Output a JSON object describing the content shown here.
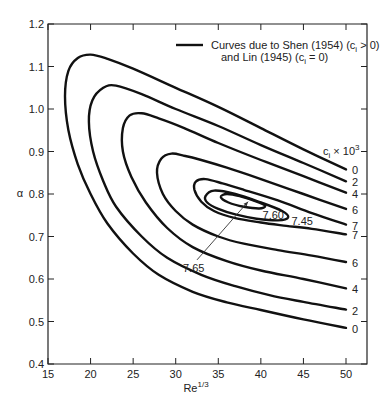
{
  "chart_data": {
    "type": "line",
    "title": "",
    "xlabel": "Re",
    "xlabel_sup": "1/3",
    "ylabel": "α",
    "xlim": [
      15,
      52
    ],
    "ylim": [
      0.4,
      1.2
    ],
    "x_ticks": [
      15,
      20,
      25,
      30,
      35,
      40,
      45,
      50
    ],
    "x_tick_labels": [
      "15",
      "20",
      "25",
      "30",
      "35",
      "40",
      "45",
      "50"
    ],
    "y_ticks": [
      0.4,
      0.5,
      0.6,
      0.7,
      0.8,
      0.9,
      1.0,
      1.1,
      1.2
    ],
    "y_tick_labels": [
      "0.4",
      "0.5",
      "0.6",
      "0.7",
      "0.8",
      "0.9",
      "1.0",
      "1.1",
      "1.2"
    ],
    "grid": false,
    "legend": {
      "placement": "top-right",
      "line1": "Curves due to Shen (1954) (c",
      "line1_sub": "i",
      "line1_end": " > 0)",
      "line2": "and Lin (1945) (c",
      "line2_sub": "i",
      "line2_end": " = 0)"
    },
    "curve_group_label": {
      "base": "c",
      "sub": "i",
      "mid": " × 10",
      "sup": "3"
    },
    "series": [
      {
        "name": "0",
        "upper_label": "0",
        "lower_label": "0",
        "points": [
          [
            50,
            0.858
          ],
          [
            45,
            0.905
          ],
          [
            40,
            0.955
          ],
          [
            35,
            1.005
          ],
          [
            30,
            1.05
          ],
          [
            25,
            1.095
          ],
          [
            22,
            1.118
          ],
          [
            20,
            1.128
          ],
          [
            18.5,
            1.12
          ],
          [
            17.4,
            1.09
          ],
          [
            17,
            1.03
          ],
          [
            17.4,
            0.95
          ],
          [
            18.5,
            0.87
          ],
          [
            20,
            0.8
          ],
          [
            22,
            0.73
          ],
          [
            25,
            0.66
          ],
          [
            28,
            0.61
          ],
          [
            32,
            0.57
          ],
          [
            36,
            0.545
          ],
          [
            40,
            0.527
          ],
          [
            45,
            0.505
          ],
          [
            50,
            0.485
          ]
        ]
      },
      {
        "name": "2",
        "upper_label": "2",
        "lower_label": "2",
        "points": [
          [
            50,
            0.83
          ],
          [
            45,
            0.873
          ],
          [
            40,
            0.915
          ],
          [
            35,
            0.96
          ],
          [
            30,
            1.0
          ],
          [
            26,
            1.035
          ],
          [
            23,
            1.055
          ],
          [
            21.5,
            1.05
          ],
          [
            20.2,
            1.02
          ],
          [
            19.8,
            0.97
          ],
          [
            20.3,
            0.9
          ],
          [
            21.5,
            0.83
          ],
          [
            23,
            0.77
          ],
          [
            26,
            0.7
          ],
          [
            29,
            0.65
          ],
          [
            33,
            0.61
          ],
          [
            37,
            0.583
          ],
          [
            41,
            0.562
          ],
          [
            45,
            0.546
          ],
          [
            50,
            0.528
          ]
        ]
      },
      {
        "name": "4",
        "upper_label": "4",
        "lower_label": "4",
        "points": [
          [
            50,
            0.803
          ],
          [
            45,
            0.842
          ],
          [
            40,
            0.88
          ],
          [
            35,
            0.92
          ],
          [
            31,
            0.955
          ],
          [
            28,
            0.978
          ],
          [
            26,
            0.99
          ],
          [
            24.6,
            0.985
          ],
          [
            23.8,
            0.955
          ],
          [
            23.8,
            0.9
          ],
          [
            24.8,
            0.84
          ],
          [
            26.5,
            0.78
          ],
          [
            29,
            0.72
          ],
          [
            32,
            0.675
          ],
          [
            36,
            0.642
          ],
          [
            40,
            0.62
          ],
          [
            45,
            0.6
          ],
          [
            50,
            0.578
          ]
        ]
      },
      {
        "name": "6",
        "upper_label": "6",
        "lower_label": "6",
        "points": [
          [
            50,
            0.765
          ],
          [
            45,
            0.8
          ],
          [
            40,
            0.835
          ],
          [
            36,
            0.862
          ],
          [
            33,
            0.88
          ],
          [
            31,
            0.89
          ],
          [
            29.5,
            0.895
          ],
          [
            28.3,
            0.883
          ],
          [
            27.8,
            0.85
          ],
          [
            28.5,
            0.8
          ],
          [
            30,
            0.76
          ],
          [
            32,
            0.728
          ],
          [
            35,
            0.7
          ],
          [
            38,
            0.683
          ],
          [
            42,
            0.668
          ],
          [
            46,
            0.655
          ],
          [
            50,
            0.64
          ]
        ]
      },
      {
        "name": "7",
        "upper_label": "7",
        "lower_label": "7",
        "points": [
          [
            50,
            0.728
          ],
          [
            46,
            0.755
          ],
          [
            42,
            0.785
          ],
          [
            38,
            0.81
          ],
          [
            35.5,
            0.825
          ],
          [
            33.5,
            0.835
          ],
          [
            32.4,
            0.83
          ],
          [
            32.2,
            0.81
          ],
          [
            33,
            0.782
          ],
          [
            34.5,
            0.76
          ],
          [
            37,
            0.743
          ],
          [
            40,
            0.733
          ],
          [
            43,
            0.725
          ],
          [
            46,
            0.718
          ],
          [
            50,
            0.705
          ]
        ]
      },
      {
        "name": "7.45",
        "closed": true,
        "label": "7.45",
        "points": [
          [
            33.5,
            0.795
          ],
          [
            34.5,
            0.808
          ],
          [
            37,
            0.8
          ],
          [
            40,
            0.78
          ],
          [
            42.5,
            0.76
          ],
          [
            43.2,
            0.745
          ],
          [
            42,
            0.738
          ],
          [
            39.5,
            0.742
          ],
          [
            37,
            0.752
          ],
          [
            35,
            0.765
          ],
          [
            33.7,
            0.78
          ]
        ]
      },
      {
        "name": "7.60",
        "closed": true,
        "label": "7.60",
        "points": [
          [
            35.3,
            0.793
          ],
          [
            36,
            0.8
          ],
          [
            37.5,
            0.795
          ],
          [
            39.5,
            0.782
          ],
          [
            40.5,
            0.772
          ],
          [
            39.8,
            0.766
          ],
          [
            38,
            0.77
          ],
          [
            36.2,
            0.78
          ]
        ]
      }
    ],
    "annotation": {
      "text": "7.65",
      "arrow_from": [
        32.5,
        0.645
      ],
      "arrow_to": [
        38.5,
        0.782
      ]
    }
  }
}
